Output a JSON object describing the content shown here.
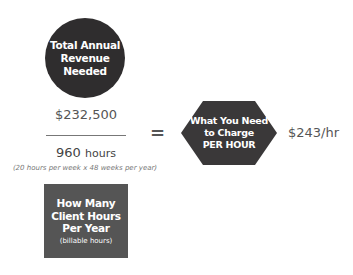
{
  "revenue_circle": {
    "label": "Total Annual Revenue Needed",
    "lines": [
      "Total Annual",
      "Revenue",
      "Needed"
    ],
    "color": "#2f2d2e"
  },
  "revenue_value": "$232,500",
  "hours_value": {
    "number": "960",
    "unit": "hours"
  },
  "hours_note": "(20 hours per week x 48 weeks per year)",
  "hours_box": {
    "lines": [
      "How Many",
      "Client Hours",
      "Per Year"
    ],
    "sub": "(billable hours)",
    "color": "#555555"
  },
  "equals": "=",
  "hexagon": {
    "lines": [
      "What You Need",
      "to Charge",
      "PER HOUR"
    ],
    "color": "#3a3839"
  },
  "result": "$243/hr"
}
